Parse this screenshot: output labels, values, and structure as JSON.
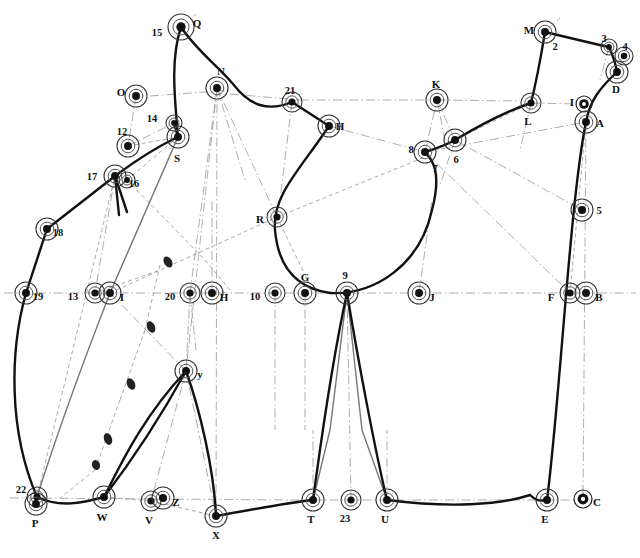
{
  "figure": {
    "type": "technical-line-diagram",
    "title": "",
    "width": 640,
    "height": 558,
    "background": "#ffffff",
    "stroke_dark": "#111111",
    "stroke_gray": "#777777",
    "stroke_light": "#999999"
  },
  "nodes": [
    {
      "id": "Q",
      "label": "Q",
      "x": 181,
      "y": 27,
      "lx": 197,
      "ly": 24,
      "r": 13,
      "style": "target"
    },
    {
      "id": "15",
      "label": "15",
      "x": 181,
      "y": 27,
      "lx": 157,
      "ly": 34,
      "r": 0,
      "style": "none"
    },
    {
      "id": "N",
      "label": "N",
      "x": 217,
      "y": 88,
      "lx": 221,
      "ly": 72,
      "r": 11,
      "style": "target"
    },
    {
      "id": "O",
      "label": "O",
      "x": 136,
      "y": 96,
      "lx": 121,
      "ly": 93,
      "r": 11,
      "style": "target"
    },
    {
      "id": "14",
      "label": "14",
      "x": 174,
      "y": 123,
      "lx": 152,
      "ly": 120,
      "r": 8,
      "style": "target"
    },
    {
      "id": "S",
      "label": "S",
      "x": 178,
      "y": 137,
      "lx": 177,
      "ly": 159,
      "r": 11,
      "style": "target"
    },
    {
      "id": "12",
      "label": "12",
      "x": 128,
      "y": 146,
      "lx": 122,
      "ly": 133,
      "r": 11,
      "style": "target"
    },
    {
      "id": "17",
      "label": "17",
      "x": 115,
      "y": 176,
      "lx": 92,
      "ly": 178,
      "r": 11,
      "style": "target"
    },
    {
      "id": "16",
      "label": "16",
      "x": 127,
      "y": 180,
      "lx": 134,
      "ly": 185,
      "r": 8,
      "style": "target"
    },
    {
      "id": "18",
      "label": "18",
      "x": 47,
      "y": 229,
      "lx": 58,
      "ly": 234,
      "r": 11,
      "style": "target"
    },
    {
      "id": "19",
      "label": "19",
      "x": 26,
      "y": 293,
      "lx": 38,
      "ly": 298,
      "r": 11,
      "style": "target"
    },
    {
      "id": "13",
      "label": "13",
      "x": 95,
      "y": 293,
      "lx": 73,
      "ly": 298,
      "r": 10,
      "style": "target"
    },
    {
      "id": "I",
      "label": "I",
      "x": 110,
      "y": 293,
      "lx": 122,
      "ly": 298,
      "r": 11,
      "style": "target"
    },
    {
      "id": "20",
      "label": "20",
      "x": 190,
      "y": 293,
      "lx": 170,
      "ly": 298,
      "r": 10,
      "style": "target"
    },
    {
      "id": "H",
      "label": "H",
      "x": 212,
      "y": 293,
      "lx": 224,
      "ly": 298,
      "r": 11,
      "style": "target"
    },
    {
      "id": "10",
      "label": "10",
      "x": 275,
      "y": 293,
      "lx": 255,
      "ly": 298,
      "r": 10,
      "style": "target"
    },
    {
      "id": "G",
      "label": "G",
      "x": 305,
      "y": 293,
      "lx": 305,
      "ly": 278,
      "r": 11,
      "style": "target"
    },
    {
      "id": "9",
      "label": "9",
      "x": 347,
      "y": 293,
      "lx": 345,
      "ly": 277,
      "r": 11,
      "style": "target"
    },
    {
      "id": "J",
      "label": "J",
      "x": 419,
      "y": 293,
      "lx": 432,
      "ly": 298,
      "r": 11,
      "style": "target"
    },
    {
      "id": "F",
      "label": "F",
      "x": 570,
      "y": 293,
      "lx": 551,
      "ly": 298,
      "r": 10,
      "style": "target"
    },
    {
      "id": "B",
      "label": "B",
      "x": 586,
      "y": 293,
      "lx": 599,
      "ly": 298,
      "r": 11,
      "style": "target"
    },
    {
      "id": "R",
      "label": "R",
      "x": 277,
      "y": 217,
      "lx": 260,
      "ly": 220,
      "r": 10,
      "style": "target"
    },
    {
      "id": "21",
      "label": "21",
      "x": 292,
      "y": 102,
      "lx": 290,
      "ly": 92,
      "r": 10,
      "style": "target"
    },
    {
      "id": "H2",
      "label": "H",
      "x": 329,
      "y": 126,
      "lx": 340,
      "ly": 127,
      "r": 11,
      "style": "target"
    },
    {
      "id": "K",
      "label": "K",
      "x": 437,
      "y": 100,
      "lx": 436,
      "ly": 85,
      "r": 11,
      "style": "target"
    },
    {
      "id": "8",
      "label": "8",
      "x": 425,
      "y": 152,
      "lx": 411,
      "ly": 151,
      "r": 11,
      "style": "target"
    },
    {
      "id": "7",
      "label": "7",
      "x": 431,
      "y": 158,
      "lx": 435,
      "ly": 170,
      "r": 0,
      "style": "none"
    },
    {
      "id": "6",
      "label": "6",
      "x": 455,
      "y": 140,
      "lx": 456,
      "ly": 161,
      "r": 11,
      "style": "target"
    },
    {
      "id": "L",
      "label": "L",
      "x": 531,
      "y": 103,
      "lx": 528,
      "ly": 122,
      "r": 10,
      "style": "target"
    },
    {
      "id": "M",
      "label": "M",
      "x": 545,
      "y": 32,
      "lx": 529,
      "ly": 31,
      "r": 11,
      "style": "target"
    },
    {
      "id": "2",
      "label": "2",
      "x": 545,
      "y": 32,
      "lx": 555,
      "ly": 48,
      "r": 0,
      "style": "none"
    },
    {
      "id": "3",
      "label": "3",
      "x": 609,
      "y": 47,
      "lx": 604,
      "ly": 40,
      "r": 8,
      "style": "target"
    },
    {
      "id": "4",
      "label": "4",
      "x": 624,
      "y": 56,
      "lx": 625,
      "ly": 48,
      "r": 9,
      "style": "target"
    },
    {
      "id": "D",
      "label": "D",
      "x": 617,
      "y": 72,
      "lx": 616,
      "ly": 90,
      "r": 11,
      "style": "target"
    },
    {
      "id": "1",
      "label": "I",
      "x": 584,
      "y": 104,
      "lx": 572,
      "ly": 103,
      "r": 8,
      "style": "ring"
    },
    {
      "id": "A",
      "label": "A",
      "x": 586,
      "y": 122,
      "lx": 600,
      "ly": 124,
      "r": 11,
      "style": "target"
    },
    {
      "id": "5",
      "label": "5",
      "x": 582,
      "y": 210,
      "lx": 599,
      "ly": 212,
      "r": 11,
      "style": "target"
    },
    {
      "id": "22",
      "label": "22",
      "x": 37,
      "y": 497,
      "lx": 21,
      "ly": 491,
      "r": 10,
      "style": "target"
    },
    {
      "id": "P",
      "label": "P",
      "x": 36,
      "y": 504,
      "lx": 35,
      "ly": 524,
      "r": 11,
      "style": "target"
    },
    {
      "id": "W",
      "label": "W",
      "x": 104,
      "y": 497,
      "lx": 102,
      "ly": 518,
      "r": 11,
      "style": "target"
    },
    {
      "id": "V",
      "label": "V",
      "x": 151,
      "y": 501,
      "lx": 149,
      "ly": 521,
      "r": 10,
      "style": "target"
    },
    {
      "id": "Z",
      "label": "Z",
      "x": 163,
      "y": 498,
      "lx": 176,
      "ly": 503,
      "r": 11,
      "style": "target"
    },
    {
      "id": "X",
      "label": "X",
      "x": 216,
      "y": 516,
      "lx": 216,
      "ly": 536,
      "r": 11,
      "style": "target"
    },
    {
      "id": "Y",
      "label": "y",
      "x": 186,
      "y": 371,
      "lx": 200,
      "ly": 375,
      "r": 11,
      "style": "target"
    },
    {
      "id": "T",
      "label": "T",
      "x": 313,
      "y": 500,
      "lx": 311,
      "ly": 520,
      "r": 11,
      "style": "target"
    },
    {
      "id": "23",
      "label": "23",
      "x": 351,
      "y": 500,
      "lx": 345,
      "ly": 520,
      "r": 10,
      "style": "target"
    },
    {
      "id": "U",
      "label": "U",
      "x": 387,
      "y": 500,
      "lx": 385,
      "ly": 520,
      "r": 11,
      "style": "target"
    },
    {
      "id": "E",
      "label": "E",
      "x": 547,
      "y": 500,
      "lx": 545,
      "ly": 520,
      "r": 11,
      "style": "target"
    },
    {
      "id": "C",
      "label": "C",
      "x": 583,
      "y": 499,
      "lx": 597,
      "ly": 503,
      "r": 9,
      "style": "ring"
    }
  ],
  "curves": {
    "thick": [
      "M181,27 C196,50 218,66 233,84 C250,106 268,112 292,102",
      "M181,27 C170,60 175,100 178,137",
      "M178,137 L174,123",
      "M178,137 C150,150 130,165 115,176",
      "M115,176 L47,229",
      "M47,229 L26,293",
      "M26,293 C10,350 8,430 37,497",
      "M37,497 C60,508 82,503 104,497",
      "M104,497 C118,470 140,420 186,371",
      "M186,371 C200,410 214,470 216,516",
      "M186,371 C170,400 140,450 104,497",
      "M216,516 C250,510 285,503 313,500",
      "M313,500 C320,450 330,370 347,293",
      "M347,293 C358,360 375,450 387,500",
      "M387,500 C450,508 500,505 530,495",
      "M530,495 C538,503 542,500 547,500",
      "M547,500 C560,400 570,200 586,122",
      "M292,102 L329,126",
      "M329,126 C300,170 272,195 275,230 C278,265 295,288 330,293",
      "M330,293 C375,295 420,265 432,210 C443,168 430,158 425,152",
      "M425,152 C438,148 448,144 455,140",
      "M455,140 C485,122 510,110 531,103",
      "M531,103 C538,75 542,50 545,32",
      "M545,32 C570,38 595,44 609,47",
      "M609,47 C614,58 616,66 617,72",
      "M617,72 C600,88 590,100 586,122",
      "M115,176 L119,215",
      "M115,176 L127,212"
    ],
    "gray": [
      "M178,137 L110,293",
      "M110,293 C80,370 55,440 37,497",
      "M347,293 L330,430 L313,500",
      "M347,293 L362,430 L387,500"
    ]
  },
  "dashdot_lines": [
    {
      "x1": 4,
      "y1": 293,
      "x2": 636,
      "y2": 293
    },
    {
      "x1": 150,
      "y1": 96,
      "x2": 232,
      "y2": 90
    },
    {
      "x1": 230,
      "y1": 94,
      "x2": 300,
      "y2": 100
    },
    {
      "x1": 300,
      "y1": 100,
      "x2": 430,
      "y2": 100
    },
    {
      "x1": 437,
      "y1": 100,
      "x2": 520,
      "y2": 101
    },
    {
      "x1": 531,
      "y1": 103,
      "x2": 578,
      "y2": 104
    },
    {
      "x1": 10,
      "y1": 498,
      "x2": 300,
      "y2": 500
    },
    {
      "x1": 313,
      "y1": 500,
      "x2": 600,
      "y2": 500
    },
    {
      "x1": 217,
      "y1": 88,
      "x2": 190,
      "y2": 293
    },
    {
      "x1": 217,
      "y1": 88,
      "x2": 216,
      "y2": 516
    },
    {
      "x1": 217,
      "y1": 88,
      "x2": 277,
      "y2": 217
    },
    {
      "x1": 217,
      "y1": 88,
      "x2": 245,
      "y2": 180
    },
    {
      "x1": 217,
      "y1": 88,
      "x2": 186,
      "y2": 371
    },
    {
      "x1": 136,
      "y1": 96,
      "x2": 128,
      "y2": 146
    },
    {
      "x1": 128,
      "y1": 146,
      "x2": 174,
      "y2": 123
    },
    {
      "x1": 115,
      "y1": 176,
      "x2": 95,
      "y2": 293
    },
    {
      "x1": 178,
      "y1": 137,
      "x2": 110,
      "y2": 293
    },
    {
      "x1": 110,
      "y1": 293,
      "x2": 186,
      "y2": 371
    },
    {
      "x1": 190,
      "y1": 293,
      "x2": 186,
      "y2": 371
    },
    {
      "x1": 186,
      "y1": 371,
      "x2": 151,
      "y2": 501
    },
    {
      "x1": 186,
      "y1": 371,
      "x2": 216,
      "y2": 516
    },
    {
      "x1": 163,
      "y1": 498,
      "x2": 151,
      "y2": 501
    },
    {
      "x1": 275,
      "y1": 293,
      "x2": 275,
      "y2": 430
    },
    {
      "x1": 305,
      "y1": 293,
      "x2": 305,
      "y2": 430
    },
    {
      "x1": 212,
      "y1": 293,
      "x2": 212,
      "y2": 200
    },
    {
      "x1": 292,
      "y1": 102,
      "x2": 280,
      "y2": 200
    },
    {
      "x1": 329,
      "y1": 126,
      "x2": 425,
      "y2": 152
    },
    {
      "x1": 425,
      "y1": 152,
      "x2": 437,
      "y2": 100
    },
    {
      "x1": 437,
      "y1": 100,
      "x2": 455,
      "y2": 140
    },
    {
      "x1": 425,
      "y1": 152,
      "x2": 570,
      "y2": 293
    },
    {
      "x1": 455,
      "y1": 140,
      "x2": 582,
      "y2": 210
    },
    {
      "x1": 425,
      "y1": 152,
      "x2": 586,
      "y2": 122
    },
    {
      "x1": 419,
      "y1": 293,
      "x2": 432,
      "y2": 200
    },
    {
      "x1": 347,
      "y1": 293,
      "x2": 351,
      "y2": 500
    },
    {
      "x1": 313,
      "y1": 500,
      "x2": 313,
      "y2": 430
    },
    {
      "x1": 387,
      "y1": 500,
      "x2": 387,
      "y2": 430
    },
    {
      "x1": 586,
      "y1": 122,
      "x2": 583,
      "y2": 499
    },
    {
      "x1": 545,
      "y1": 32,
      "x2": 560,
      "y2": 18
    },
    {
      "x1": 181,
      "y1": 27,
      "x2": 196,
      "y2": 14
    },
    {
      "x1": 609,
      "y1": 47,
      "x2": 600,
      "y2": 80
    },
    {
      "x1": 617,
      "y1": 72,
      "x2": 605,
      "y2": 60
    },
    {
      "x1": 455,
      "y1": 140,
      "x2": 440,
      "y2": 185
    },
    {
      "x1": 531,
      "y1": 103,
      "x2": 520,
      "y2": 150
    },
    {
      "x1": 190,
      "y1": 293,
      "x2": 196,
      "y2": 350
    },
    {
      "x1": 437,
      "y1": 100,
      "x2": 445,
      "y2": 140
    }
  ],
  "dashed_lines": [
    {
      "x1": 128,
      "y1": 146,
      "x2": 178,
      "y2": 137
    },
    {
      "x1": 178,
      "y1": 137,
      "x2": 127,
      "y2": 180
    },
    {
      "x1": 127,
      "y1": 180,
      "x2": 205,
      "y2": 260
    },
    {
      "x1": 205,
      "y1": 260,
      "x2": 230,
      "y2": 290
    },
    {
      "x1": 110,
      "y1": 293,
      "x2": 277,
      "y2": 217
    },
    {
      "x1": 277,
      "y1": 217,
      "x2": 430,
      "y2": 155
    },
    {
      "x1": 160,
      "y1": 265,
      "x2": 145,
      "y2": 330
    },
    {
      "x1": 145,
      "y1": 330,
      "x2": 120,
      "y2": 400
    },
    {
      "x1": 120,
      "y1": 400,
      "x2": 95,
      "y2": 470
    },
    {
      "x1": 95,
      "y1": 470,
      "x2": 60,
      "y2": 498
    },
    {
      "x1": 95,
      "y1": 293,
      "x2": 160,
      "y2": 270
    },
    {
      "x1": 277,
      "y1": 217,
      "x2": 310,
      "y2": 285
    },
    {
      "x1": 425,
      "y1": 152,
      "x2": 455,
      "y2": 140
    },
    {
      "x1": 455,
      "y1": 140,
      "x2": 531,
      "y2": 103
    },
    {
      "x1": 586,
      "y1": 122,
      "x2": 570,
      "y2": 293
    },
    {
      "x1": 104,
      "y1": 497,
      "x2": 151,
      "y2": 501
    },
    {
      "x1": 151,
      "y1": 501,
      "x2": 216,
      "y2": 516
    },
    {
      "x1": 37,
      "y1": 497,
      "x2": 115,
      "y2": 176
    },
    {
      "x1": 609,
      "y1": 47,
      "x2": 624,
      "y2": 56
    },
    {
      "x1": 617,
      "y1": 72,
      "x2": 624,
      "y2": 56
    }
  ],
  "blobs": [
    {
      "x": 168,
      "y": 262,
      "rx": 4,
      "ry": 6,
      "rot": -30
    },
    {
      "x": 151,
      "y": 327,
      "rx": 4,
      "ry": 6,
      "rot": -25
    },
    {
      "x": 131,
      "y": 384,
      "rx": 4,
      "ry": 6,
      "rot": -25
    },
    {
      "x": 108,
      "y": 439,
      "rx": 4,
      "ry": 6,
      "rot": -20
    },
    {
      "x": 96,
      "y": 465,
      "rx": 4,
      "ry": 5,
      "rot": -20
    }
  ]
}
